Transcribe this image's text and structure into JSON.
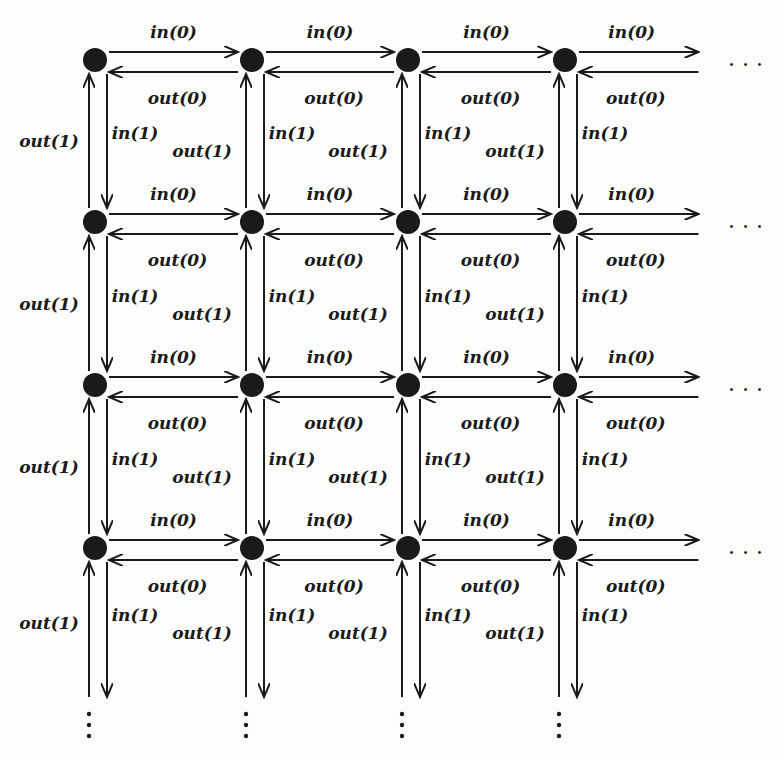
{
  "diagram": {
    "type": "grid-network",
    "columns": 4,
    "rows": 4,
    "node_x": [
      95,
      252,
      408,
      565
    ],
    "node_y": [
      60,
      222,
      385,
      548
    ],
    "node_color": "#1a1a1a",
    "labels": {
      "in0": "in(0)",
      "out0": "out(0)",
      "in1": "in(1)",
      "out1": "out(1)"
    },
    "continuation_right": "· · ·",
    "continuation_down": "⋮"
  }
}
